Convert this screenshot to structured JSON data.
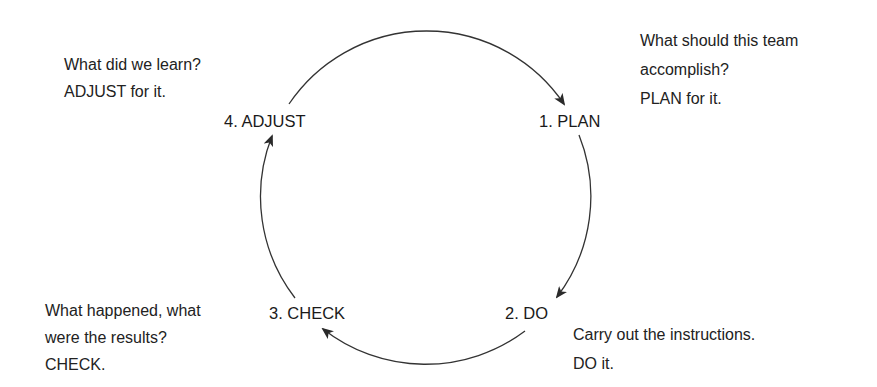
{
  "diagram": {
    "type": "cycle",
    "stroke_color": "#333333",
    "stages": [
      {
        "id": "plan",
        "label": "1. PLAN",
        "description": [
          "What should this team",
          "accomplish?",
          "PLAN for it."
        ]
      },
      {
        "id": "do",
        "label": "2. DO",
        "description": [
          "Carry out the instructions.",
          "DO it."
        ]
      },
      {
        "id": "check",
        "label": "3. CHECK",
        "description": [
          "What happened, what",
          "were the results?",
          "CHECK."
        ]
      },
      {
        "id": "adjust",
        "label": "4. ADJUST",
        "description": [
          "What did we learn?",
          "ADJUST for it."
        ]
      }
    ],
    "flow": [
      "plan -> do",
      "do -> check",
      "check -> adjust",
      "adjust -> plan"
    ],
    "direction": "clockwise"
  }
}
